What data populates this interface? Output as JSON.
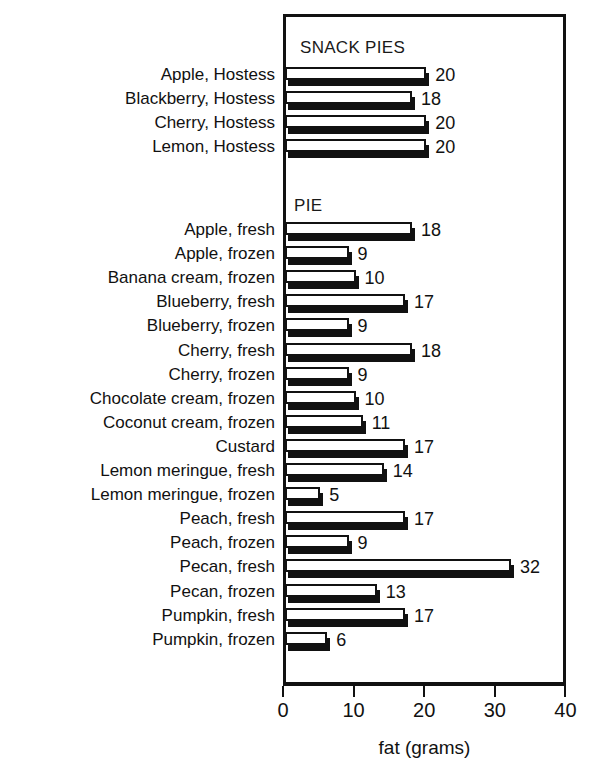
{
  "chart_data": {
    "type": "bar",
    "orientation": "horizontal",
    "title": "",
    "xlabel": "fat (grams)",
    "ylabel": "",
    "xlim": [
      0,
      40
    ],
    "xticks": [
      0,
      10,
      20,
      30,
      40
    ],
    "xtick_labels": [
      "0",
      "10",
      "20",
      "30",
      "40"
    ],
    "grid": false,
    "legend": null,
    "value_labels": true,
    "groups": [
      {
        "name": "SNACK PIES",
        "categories": [
          "Apple, Hostess",
          "Blackberry, Hostess",
          "Cherry, Hostess",
          "Lemon, Hostess"
        ],
        "values": [
          20,
          18,
          20,
          20
        ]
      },
      {
        "name": "PIE",
        "categories": [
          "Apple, fresh",
          "Apple, frozen",
          "Banana cream, frozen",
          "Blueberry, fresh",
          "Blueberry, frozen",
          "Cherry, fresh",
          "Cherry, frozen",
          "Chocolate cream, frozen",
          "Coconut cream, frozen",
          "Custard",
          "Lemon meringue, fresh",
          "Lemon meringue, frozen",
          "Peach, fresh",
          "Peach, frozen",
          "Pecan, fresh",
          "Pecan, frozen",
          "Pumpkin, fresh",
          "Pumpkin, frozen"
        ],
        "values": [
          18,
          9,
          10,
          17,
          9,
          18,
          9,
          10,
          11,
          17,
          14,
          5,
          17,
          9,
          32,
          13,
          17,
          6
        ]
      }
    ],
    "colors": {
      "bar_face": "#ffffff",
      "bar_outline": "#111111",
      "bar_shadow": "#111111",
      "axis": "#111111",
      "text": "#111111",
      "background": "#ffffff"
    }
  },
  "axis": {
    "title": "fat (grams)",
    "ticks": [
      "0",
      "10",
      "20",
      "30",
      "40"
    ]
  }
}
